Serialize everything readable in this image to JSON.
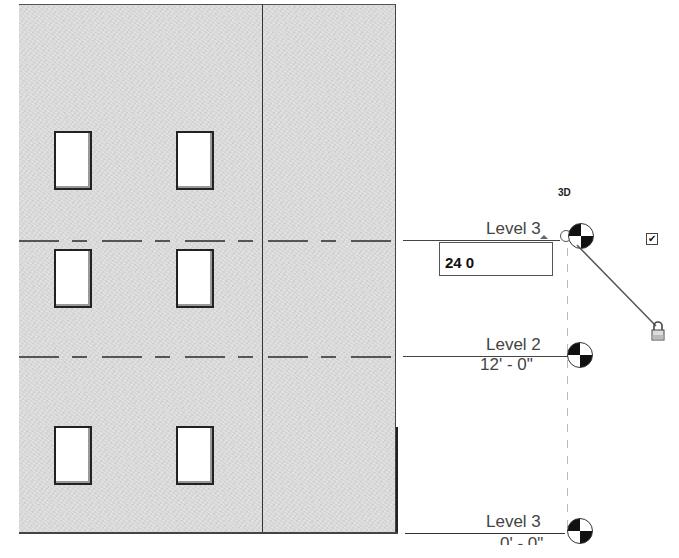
{
  "view": {
    "type": "elevation",
    "tag_3d": "3D"
  },
  "levels": [
    {
      "name": "Level 3",
      "elevation": "",
      "edit_value": "24 0"
    },
    {
      "name": "Level 2",
      "elevation": "12' - 0\""
    },
    {
      "name": "Level 1",
      "elevation": "0' - 0\""
    }
  ],
  "edit_box": {
    "value": "24 0"
  },
  "controls": {
    "checkbox_checked": "✔",
    "lock_icon": "lock-icon",
    "checkbox_icon": "checkbox-icon"
  },
  "colors": {
    "wall_fill": "#d9d9d9",
    "line": "#444444",
    "marker_dark": "#111111"
  }
}
